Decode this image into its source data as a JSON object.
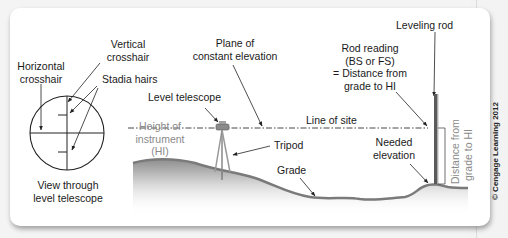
{
  "diagram": {
    "reticle": {
      "labels": {
        "vertical_crosshair": [
          "Vertical",
          "crosshair"
        ],
        "horizontal_crosshair": [
          "Horizontal",
          "crosshair"
        ],
        "stadia_hairs": "Stadia hairs",
        "caption": [
          "View through",
          "level telescope"
        ]
      }
    },
    "field": {
      "labels": {
        "plane": [
          "Plane of",
          "constant elevation"
        ],
        "level_telescope": "Level telescope",
        "height_of_instrument": [
          "Height of",
          "instrument",
          "(HI)"
        ],
        "line_of_site": "Line of site",
        "tripod": "Tripod",
        "grade": "Grade",
        "leveling_rod": "Leveling rod",
        "rod_reading": [
          "Rod reading",
          "(BS or FS)",
          "= Distance from",
          "grade to HI"
        ],
        "needed_elevation": [
          "Needed",
          "elevation"
        ],
        "distance_from_grade": [
          "Distance from",
          "grade to HI"
        ]
      }
    },
    "credit": "© Cengage Learning 2012",
    "colors": {
      "line": "#222222",
      "gray_text": "#8a8a8a",
      "ground": "#9a9a9a",
      "rod": "#555555"
    }
  }
}
